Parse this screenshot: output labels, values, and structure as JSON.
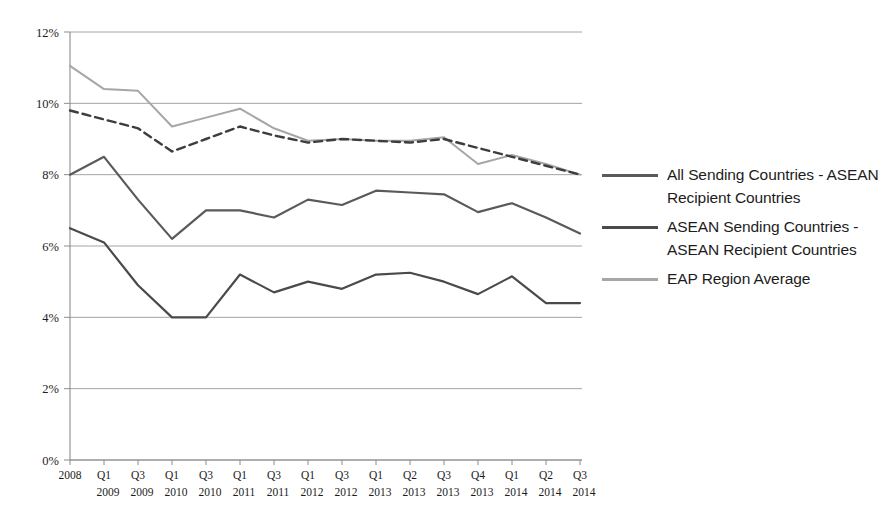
{
  "chart_data": {
    "type": "line",
    "title": "",
    "subtitle": "",
    "xlabel": "",
    "ylabel": "",
    "ylim": [
      0,
      12
    ],
    "yticks": [
      0,
      2,
      4,
      6,
      8,
      10,
      12
    ],
    "ytick_labels": [
      "0%",
      "2%",
      "4%",
      "6%",
      "8%",
      "10%",
      "12%"
    ],
    "grid": "horizontal",
    "legend_position": "right",
    "categories": [
      "2008",
      "Q1 2009",
      "Q3 2009",
      "Q1 2010",
      "Q3 2010",
      "Q1 2011",
      "Q3 2011",
      "Q1 2012",
      "Q3 2012",
      "Q1 2013",
      "Q2 2013",
      "Q3 2013",
      "Q4 2013",
      "Q1 2014",
      "Q2 2014",
      "Q3 2014"
    ],
    "xtick_top": [
      "2008",
      "Q1",
      "Q3",
      "Q1",
      "Q3",
      "Q1",
      "Q3",
      "Q1",
      "Q3",
      "Q1",
      "Q2",
      "Q3",
      "Q4",
      "Q1",
      "Q2",
      "Q3"
    ],
    "xtick_bottom": [
      "",
      "2009",
      "2009",
      "2010",
      "2010",
      "2011",
      "2011",
      "2012",
      "2012",
      "2013",
      "2013",
      "2013",
      "2013",
      "2014",
      "2014",
      "2014"
    ],
    "series": [
      {
        "name": "All Sending Countries - ASEAN Recipient Countries",
        "style": "solid",
        "color": "#5a5a5a",
        "width": 2.2,
        "in_legend": true,
        "values": [
          8.0,
          8.5,
          7.3,
          6.2,
          7.0,
          7.0,
          6.8,
          7.3,
          7.15,
          7.55,
          7.5,
          7.45,
          6.95,
          7.2,
          6.8,
          6.35
        ]
      },
      {
        "name": "ASEAN Sending Countries - ASEAN Recipient Countries",
        "style": "solid",
        "color": "#4a4a4a",
        "width": 2.2,
        "in_legend": true,
        "values": [
          6.5,
          6.1,
          4.9,
          4.0,
          4.0,
          5.2,
          4.7,
          5.0,
          4.8,
          5.2,
          5.25,
          5.0,
          4.65,
          5.15,
          4.4,
          4.4
        ]
      },
      {
        "name": "EAP Region Average",
        "style": "solid",
        "color": "#a6a6a6",
        "width": 2.0,
        "in_legend": true,
        "values": [
          11.05,
          10.4,
          10.35,
          9.35,
          9.6,
          9.85,
          9.3,
          8.95,
          9.0,
          8.95,
          8.95,
          9.05,
          8.3,
          8.55,
          8.3,
          8.0
        ]
      },
      {
        "name": "Unlabeled dashed series",
        "style": "dashed",
        "color": "#3d3d3d",
        "width": 2.4,
        "in_legend": false,
        "values": [
          9.8,
          9.55,
          9.3,
          8.65,
          9.0,
          9.35,
          9.1,
          8.9,
          9.0,
          8.95,
          8.9,
          9.0,
          8.75,
          8.5,
          8.25,
          8.0
        ]
      }
    ]
  },
  "legend": {
    "items": [
      {
        "label": "All Sending Countries - ASEAN Recipient Countries",
        "color": "#5a5a5a"
      },
      {
        "label": "ASEAN Sending Countries - ASEAN Recipient Countries",
        "color": "#4a4a4a"
      },
      {
        "label": "EAP Region Average",
        "color": "#a6a6a6"
      }
    ]
  },
  "axis": {
    "gridline_color": "#9a9a9a",
    "axis_color": "#8c8c8c"
  }
}
